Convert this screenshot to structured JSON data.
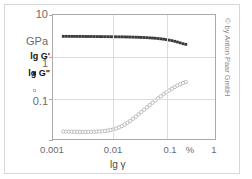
{
  "figure": {
    "copyright": "© by Anton Paar GmbH"
  },
  "legend": {
    "entries": [
      {
        "label": "lg G'",
        "marker": "filled-square",
        "color": "#3a3a3a"
      },
      {
        "label": "lg G\"",
        "marker": "open-circle",
        "color": "#b8b8b8"
      }
    ]
  },
  "axes": {
    "y_unit": "GPa",
    "y_ticks": [
      "10",
      "1",
      "0.1"
    ],
    "x_ticks": [
      "0.001",
      "0.01",
      "0.1",
      "1"
    ],
    "x_unit": "%",
    "x_title": "lg γ",
    "yield_arrow": "↑"
  },
  "chart_data": {
    "type": "scatter",
    "title": "",
    "xlabel": "lg γ",
    "ylabel": "GPa",
    "xscale": "log",
    "yscale": "log",
    "xlim": [
      0.001,
      1
    ],
    "ylim": [
      0.01,
      10
    ],
    "xunit": "%",
    "yunit": "GPa",
    "grid": true,
    "legend_position": "left-outside",
    "annotations": [
      {
        "text": "↑",
        "x": 0.02,
        "y": 0.013,
        "note": "yield point / limit of LVE range"
      }
    ],
    "series": [
      {
        "name": "lg G'",
        "marker": "filled-square",
        "color": "#3a3a3a",
        "x": [
          0.00155,
          0.00175,
          0.00197,
          0.00222,
          0.0025,
          0.00282,
          0.00317,
          0.00357,
          0.00402,
          0.00453,
          0.0051,
          0.00574,
          0.00647,
          0.00728,
          0.0082,
          0.00923,
          0.0104,
          0.0117,
          0.0132,
          0.0148,
          0.0167,
          0.0188,
          0.0212,
          0.0239,
          0.0269,
          0.0303,
          0.0341,
          0.0384,
          0.0432,
          0.0487,
          0.0548,
          0.0617,
          0.0695,
          0.0782,
          0.088,
          0.0991,
          0.1116,
          0.1256,
          0.1414,
          0.1592,
          0.1793,
          0.2018,
          0.2272,
          0.2558,
          0.288
        ],
        "y": [
          3.05,
          3.05,
          3.04,
          3.04,
          3.04,
          3.03,
          3.03,
          3.03,
          3.02,
          3.02,
          3.02,
          3.01,
          3.01,
          3.0,
          3.0,
          2.99,
          2.99,
          2.98,
          2.98,
          2.97,
          2.96,
          2.96,
          2.95,
          2.94,
          2.93,
          2.92,
          2.9,
          2.89,
          2.87,
          2.85,
          2.83,
          2.8,
          2.77,
          2.74,
          2.7,
          2.65,
          2.6,
          2.54,
          2.47,
          2.4,
          2.31,
          2.22,
          2.12,
          2.02,
          1.95
        ]
      },
      {
        "name": "lg G\"",
        "marker": "open-circle",
        "color": "#b0b0b0",
        "x": [
          0.00155,
          0.00175,
          0.00197,
          0.00222,
          0.0025,
          0.00282,
          0.00317,
          0.00357,
          0.00402,
          0.00453,
          0.0051,
          0.00574,
          0.00647,
          0.00728,
          0.0082,
          0.00923,
          0.0104,
          0.0117,
          0.0132,
          0.0148,
          0.0167,
          0.0188,
          0.0212,
          0.0239,
          0.0269,
          0.0303,
          0.0341,
          0.0384,
          0.0432,
          0.0487,
          0.0548,
          0.0617,
          0.0695,
          0.0782,
          0.088,
          0.0991,
          0.1116,
          0.1256,
          0.1414,
          0.1592,
          0.1793,
          0.2018,
          0.2272,
          0.2558,
          0.288
        ],
        "y": [
          0.0152,
          0.0151,
          0.015,
          0.015,
          0.0149,
          0.0149,
          0.0148,
          0.0148,
          0.0148,
          0.0149,
          0.0149,
          0.015,
          0.0151,
          0.0152,
          0.0154,
          0.0157,
          0.0161,
          0.0166,
          0.0172,
          0.018,
          0.0191,
          0.0205,
          0.0223,
          0.0246,
          0.0274,
          0.0308,
          0.0348,
          0.0395,
          0.0449,
          0.0512,
          0.0583,
          0.0663,
          0.0753,
          0.0852,
          0.0962,
          0.1082,
          0.1212,
          0.135,
          0.1496,
          0.1648,
          0.1804,
          0.1962,
          0.2118,
          0.2268,
          0.239
        ]
      }
    ]
  }
}
